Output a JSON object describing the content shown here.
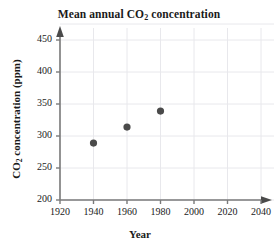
{
  "chart_data": {
    "type": "scatter",
    "title": "Mean annual CO2 concentration",
    "title_parts": {
      "before": "Mean annual CO",
      "sub": "2",
      "after": " concentration"
    },
    "xlabel": "Year",
    "ylabel": "CO2 concentration (ppm)",
    "ylabel_parts": {
      "before": "CO",
      "sub": "2",
      "after": " concentration (ppm)"
    },
    "x": [
      1940,
      1960,
      1980
    ],
    "values": [
      289,
      314,
      339
    ],
    "points": [
      {
        "x": 1940,
        "y": 289
      },
      {
        "x": 1960,
        "y": 314
      },
      {
        "x": 1980,
        "y": 339
      }
    ],
    "series": [
      {
        "name": "Mean annual CO2 concentration",
        "values": [
          289,
          314,
          339
        ]
      }
    ],
    "xlim": [
      1920,
      2040
    ],
    "ylim": [
      200,
      450
    ],
    "xticks": [
      1920,
      1940,
      1960,
      1980,
      2000,
      2020,
      2040
    ],
    "yticks": [
      200,
      250,
      300,
      350,
      400,
      450
    ],
    "xtick_labels": [
      "1920",
      "1940",
      "1960",
      "1980",
      "2000",
      "2020",
      "2040"
    ],
    "ytick_labels": [
      "200",
      "250",
      "300",
      "350",
      "400",
      "450"
    ],
    "grid": true,
    "legend": "none",
    "marker_color": "#4a4a4a",
    "axis_color": "#7a7a7a",
    "grid_color": "#e8e8ec",
    "axis_arrows": [
      "up",
      "right"
    ]
  }
}
